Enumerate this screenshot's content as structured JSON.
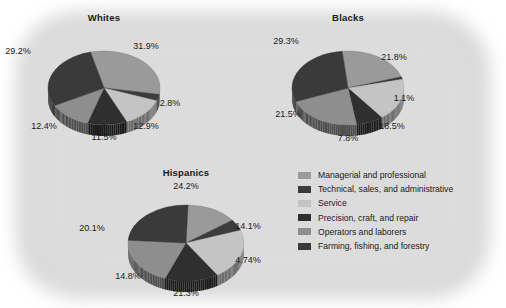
{
  "chart_data": [
    {
      "type": "pie",
      "title": "Whites",
      "categories": [
        "Managerial and professional",
        "Technical, sales, and administrative",
        "Service",
        "Precision, craft, and repair",
        "Operators and laborers",
        "Farming, fishing, and forestry"
      ],
      "values": [
        31.9,
        2.8,
        12.9,
        11.5,
        12.4,
        29.2
      ],
      "labels": [
        "31.9%",
        "2.8%",
        "12.9%",
        "11.5%",
        "12.4%",
        "29.2%"
      ]
    },
    {
      "type": "pie",
      "title": "Blacks",
      "categories": [
        "Managerial and professional",
        "Technical, sales, and administrative",
        "Service",
        "Precision, craft, and repair",
        "Operators and laborers",
        "Farming, fishing, and forestry"
      ],
      "values": [
        21.8,
        1.1,
        18.5,
        7.8,
        21.5,
        29.3
      ],
      "labels": [
        "21.8%",
        "1.1%",
        "18.5%",
        "7.8%",
        "21.5%",
        "29.3%"
      ]
    },
    {
      "type": "pie",
      "title": "Hispanics",
      "categories": [
        "Managerial and professional",
        "Technical, sales, and administrative",
        "Service",
        "Precision, craft, and repair",
        "Operators and laborers",
        "Farming, fishing, and forestry"
      ],
      "values": [
        14.1,
        4.74,
        21.3,
        14.8,
        20.1,
        24.2
      ],
      "labels": [
        "14.1%",
        "4.74%",
        "21.3%",
        "14.8%",
        "20.1%",
        "24.2%"
      ]
    }
  ],
  "legend": {
    "position": "right",
    "items": [
      {
        "label": "Managerial and professional",
        "color": "#9a9a9a"
      },
      {
        "label": "Technical, sales, and administrative",
        "color": "#3c3c3c"
      },
      {
        "label": "Service",
        "color": "#c4c4c4"
      },
      {
        "label": "Precision, craft, and repair",
        "color": "#2f2f2f"
      },
      {
        "label": "Operators and laborers",
        "color": "#8e8e8e"
      },
      {
        "label": "Farming, fishing, and forestry",
        "color": "#3a3a3a"
      }
    ]
  },
  "palette": {
    "managerial": "#9a9a9a",
    "technical": "#3c3c3c",
    "service": "#c4c4c4",
    "precision": "#2f2f2f",
    "operators": "#8e8e8e",
    "farming": "#3a3a3a",
    "background_blob": "#d8d8d8",
    "page_background": "#ffffff",
    "text": "#1a1a1a"
  },
  "geometry": [
    {
      "cx": 104,
      "cy": 88,
      "rx": 56,
      "ry": 37,
      "depth": 11,
      "start": -104,
      "title_x": 104,
      "title_y": 12,
      "label_pos": [
        [
          146,
          46
        ],
        [
          170,
          103
        ],
        [
          146,
          126
        ],
        [
          104,
          137
        ],
        [
          44,
          126
        ],
        [
          18,
          51
        ]
      ]
    },
    {
      "cx": 348,
      "cy": 88,
      "rx": 56,
      "ry": 37,
      "depth": 11,
      "start": -96,
      "title_x": 348,
      "title_y": 12,
      "label_pos": [
        [
          394,
          57
        ],
        [
          404,
          98
        ],
        [
          392,
          126
        ],
        [
          348,
          138
        ],
        [
          288,
          114
        ],
        [
          286,
          41
        ]
      ]
    },
    {
      "cx": 186,
      "cy": 243,
      "rx": 58,
      "ry": 38,
      "depth": 11,
      "start": -88,
      "title_x": 186,
      "title_y": 167,
      "label_pos": [
        [
          248,
          226
        ],
        [
          248,
          260
        ],
        [
          186,
          293
        ],
        [
          128,
          276
        ],
        [
          92,
          228
        ],
        [
          186,
          186
        ]
      ]
    }
  ]
}
